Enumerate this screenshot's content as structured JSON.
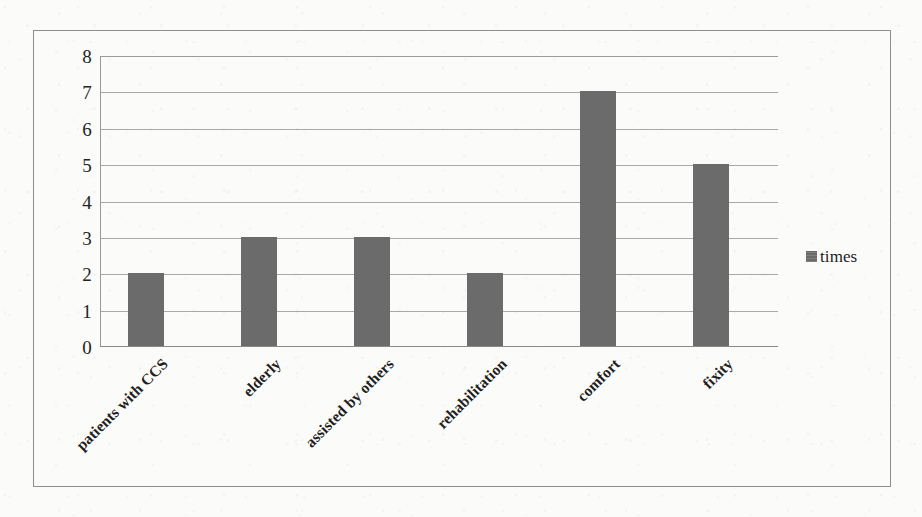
{
  "chart_data": {
    "type": "bar",
    "title": "",
    "subtitle": "",
    "xlabel": "",
    "ylabel": "",
    "categories": [
      "patients with CCS",
      "elderly",
      "assisted by others",
      "rehabilitation",
      "comfort",
      "fixity"
    ],
    "series": [
      {
        "name": "times",
        "values": [
          2,
          3,
          3,
          2,
          7,
          5
        ],
        "color": "#6b6b6b"
      }
    ],
    "values": [
      2,
      3,
      3,
      2,
      7,
      5
    ],
    "ylim": [
      0,
      8
    ],
    "ytick_step": 1,
    "yticks": [
      "8",
      "7",
      "6",
      "5",
      "4",
      "3",
      "2",
      "1",
      "0"
    ],
    "ytick_values": [
      8,
      7,
      6,
      5,
      4,
      3,
      2,
      1,
      0
    ],
    "grid": true,
    "grid_axis": "y",
    "legend": {
      "position": "right",
      "entries": [
        {
          "label": "times",
          "color": "#6b6b6b",
          "marker": "filled-square"
        }
      ]
    },
    "xtick_rotation": -45,
    "annotations": [],
    "colors": {
      "bar": "#6b6b6b",
      "gridline": "#a8a8a8",
      "axis": "#8a8a8a",
      "frame": "#8e8e8e",
      "text": "#222222",
      "background": "#fbfbf9"
    }
  }
}
